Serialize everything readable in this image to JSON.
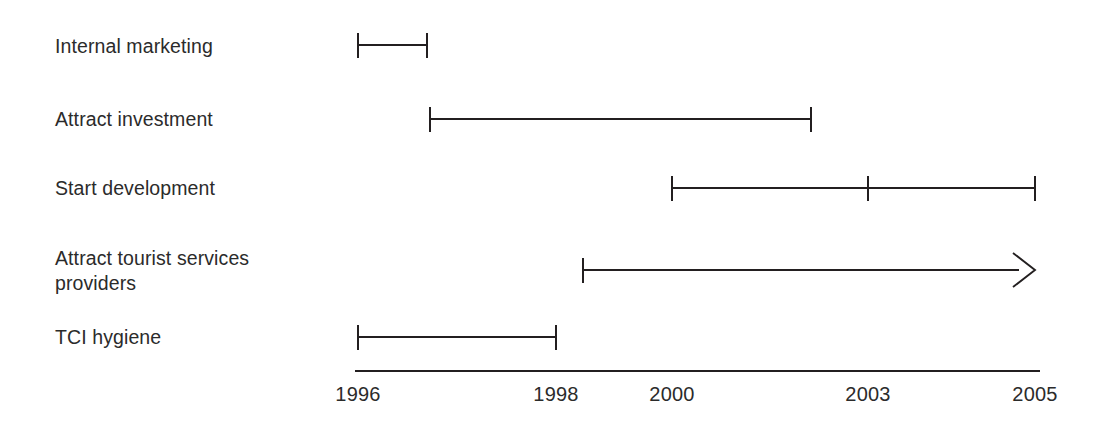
{
  "chart_data": {
    "type": "bar",
    "title": "",
    "subtitle": "",
    "xlabel": "",
    "ylabel": "",
    "orientation": "horizontal",
    "style": "gantt-timeline",
    "grid": false,
    "legend": null,
    "axis": {
      "position": "bottom",
      "line_color": "#231f20",
      "xlim": [
        1996,
        2005
      ],
      "ticks": [
        {
          "label": "1996",
          "value": 1996,
          "x": 358
        },
        {
          "label": "1998",
          "value": 1998,
          "x": 556
        },
        {
          "label": "2000",
          "value": 2000,
          "x": 672
        },
        {
          "label": "2003",
          "value": 2003,
          "x": 868
        },
        {
          "label": "2005",
          "value": 2005,
          "x": 1035
        }
      ]
    },
    "categories": [
      "Internal marketing",
      "Attract investment",
      "Start development",
      "Attract tourist services providers",
      "TCI hygiene"
    ],
    "bars": [
      {
        "label": "Internal marketing",
        "label_lines": [
          "Internal marketing"
        ],
        "label_y": 34,
        "row_y": 45,
        "start_x": 358,
        "end_x": 427,
        "start_year": 1996,
        "end_year": 1996.7,
        "start_cap": "tick",
        "end_cap": "tick",
        "milestones": []
      },
      {
        "label": "Attract investment",
        "label_lines": [
          "Attract investment"
        ],
        "label_y": 107,
        "row_y": 119,
        "start_x": 430,
        "end_x": 811,
        "start_year": 1996.75,
        "end_year": 2002.4,
        "start_cap": "tick",
        "end_cap": "tick",
        "milestones": []
      },
      {
        "label": "Start development",
        "label_lines": [
          "Start development"
        ],
        "label_y": 176,
        "row_y": 188,
        "start_x": 672,
        "end_x": 1035,
        "start_year": 2000,
        "end_year": 2005,
        "start_cap": "tick",
        "end_cap": "tick",
        "milestones": [
          {
            "label": "2003",
            "value": 2003,
            "x": 868
          }
        ]
      },
      {
        "label": "Attract tourist services providers",
        "label_lines": [
          "Attract tourist services",
          "providers"
        ],
        "label_y": 246,
        "row_y": 270,
        "start_x": 583,
        "end_x": 1035,
        "start_year": 1998.5,
        "end_year": 2005,
        "start_cap": "tick",
        "end_cap": "arrow",
        "milestones": []
      },
      {
        "label": "TCI hygiene",
        "label_lines": [
          "TCI hygiene"
        ],
        "label_y": 325,
        "row_y": 337,
        "start_x": 358,
        "end_x": 556,
        "start_year": 1996,
        "end_year": 1998,
        "start_cap": "tick",
        "end_cap": "tick",
        "milestones": []
      }
    ],
    "colors": {
      "bar": "#231f20",
      "axis": "#231f20",
      "text": "#2b2b2b",
      "background": "#ffffff"
    }
  },
  "labels": {
    "row0": "Internal marketing",
    "row1": "Attract investment",
    "row2": "Start development",
    "row3": "Attract tourist services\nproviders",
    "row4": "TCI hygiene"
  },
  "ticks": {
    "t0": "1996",
    "t1": "1998",
    "t2": "2000",
    "t3": "2003",
    "t4": "2005"
  }
}
